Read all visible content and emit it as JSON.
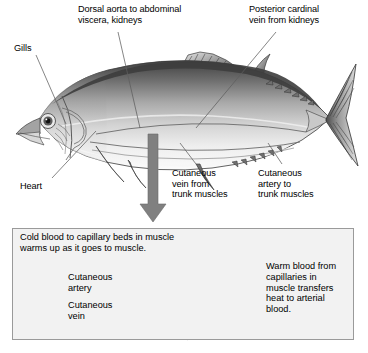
{
  "figure": {
    "background_color": "#ffffff"
  },
  "fish_labels": [
    {
      "id": "dorsal-aorta",
      "text": "Dorsal aorta to abdominal\nviscera, kidneys",
      "x": 78,
      "y": 4
    },
    {
      "id": "posterior-cardinal-vein",
      "text": "Posterior cardinal\nvein from kidneys",
      "x": 249,
      "y": 4
    },
    {
      "id": "gills",
      "text": "Gills",
      "x": 14,
      "y": 43
    },
    {
      "id": "heart",
      "text": "Heart",
      "x": 20,
      "y": 181
    },
    {
      "id": "cutaneous-vein-trunk",
      "text": "Cutaneous\nvein from\ntrunk muscles",
      "x": 172,
      "y": 168
    },
    {
      "id": "cutaneous-artery-trunk",
      "text": "Cutaneous\nartery to\ntrunk muscles",
      "x": 258,
      "y": 168
    }
  ],
  "arrow": {
    "name": "down-arrow",
    "color": "#808080",
    "direction": "down"
  },
  "inset": {
    "border_color": "#9a9a9a",
    "background_color": "#f2f2f2",
    "caption": "Cold blood to capillary beds in muscle\nwarms up as it goes to muscle.",
    "labels": [
      {
        "id": "cutaneous-artery",
        "text": "Cutaneous\nartery",
        "x": 68,
        "y": 272
      },
      {
        "id": "cutaneous-vein",
        "text": "Cutaneous\nvein",
        "x": 68,
        "y": 300
      },
      {
        "id": "warm-blood-note",
        "text": "Warm blood from\ncapillaries in\nmuscle transfers\nheat to arterial\nblood.",
        "x": 266,
        "y": 261
      }
    ],
    "vessels": [
      {
        "id": "artery-vessel-node",
        "cx": 152,
        "cy": 287,
        "r": 8
      },
      {
        "id": "vein-vessel-node",
        "cx": 152,
        "cy": 312,
        "r": 8
      }
    ]
  },
  "colors": {
    "ink": "#000000",
    "leader_line": "#666666",
    "fish_dark": "#4a4a4a",
    "fish_mid": "#8d8d8d",
    "fish_light": "#d8d8d8",
    "fish_belly": "#f0f0f0",
    "vessel": "#7d7d7d",
    "arrow": "#808080"
  }
}
